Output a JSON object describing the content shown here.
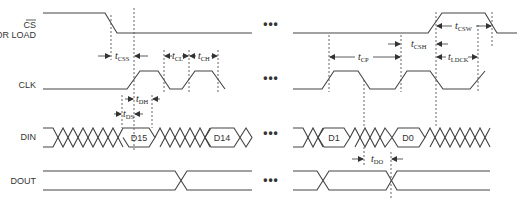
{
  "caption": "",
  "signals": {
    "cs": {
      "label_line1": "CS",
      "label_line2": "OR LOAD"
    },
    "clk": {
      "label": "CLK"
    },
    "din": {
      "label": "DIN"
    },
    "dout": {
      "label": "DOUT"
    }
  },
  "data_bits": {
    "left": [
      "D15",
      "D14"
    ],
    "right": [
      "D1",
      "D0"
    ]
  },
  "timing_params": [
    {
      "id": "tCSS",
      "main": "t",
      "sub": "CSS"
    },
    {
      "id": "tCL",
      "main": "t",
      "sub": "CL"
    },
    {
      "id": "tCH",
      "main": "t",
      "sub": "CH"
    },
    {
      "id": "tDH",
      "main": "t",
      "sub": "DH"
    },
    {
      "id": "tDS",
      "main": "t",
      "sub": "DS"
    },
    {
      "id": "tCP",
      "main": "t",
      "sub": "CP"
    },
    {
      "id": "tCSH",
      "main": "t",
      "sub": "CSH"
    },
    {
      "id": "tCSW",
      "main": "t",
      "sub": "CSW"
    },
    {
      "id": "tLDCK",
      "main": "t",
      "sub": "LDCK"
    },
    {
      "id": "tDO",
      "main": "t",
      "sub": "DO"
    }
  ],
  "ellipsis": "•••"
}
